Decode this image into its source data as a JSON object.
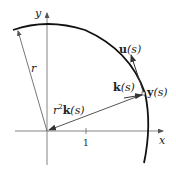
{
  "diagram": {
    "axes": {
      "x_label": "x",
      "y_label": "y",
      "tick_label": "1"
    },
    "labels": {
      "radius": "r",
      "position_vec_bold": "y",
      "position_vec_arg": "(s)",
      "tangent_bold": "u",
      "tangent_arg": "(s)",
      "curvature_bold": "k",
      "curvature_arg": "(s)",
      "scaled_prefix": "r",
      "scaled_exp": "2",
      "scaled_bold": "k",
      "scaled_arg": "(s)"
    },
    "colors": {
      "curve": "#111111",
      "axes": "#555555",
      "vectors": "#444444"
    }
  }
}
